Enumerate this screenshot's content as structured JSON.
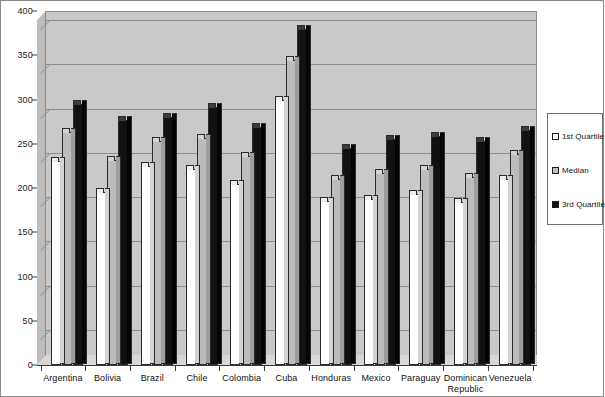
{
  "chart_data": {
    "type": "bar",
    "title": "",
    "subtitle": "",
    "xlabel": "",
    "ylabel": "",
    "ylim": [
      0,
      400
    ],
    "yticks": [
      0,
      50,
      100,
      150,
      200,
      250,
      300,
      350,
      400
    ],
    "grid": true,
    "legend_position": "right",
    "categories": [
      "Argentina",
      "Bolivia",
      "Brazil",
      "Chile",
      "Colombia",
      "Cuba",
      "Honduras",
      "Mexico",
      "Paraguay",
      "Dominican Republic",
      "Venezuela"
    ],
    "series": [
      {
        "name": "1st Quartile",
        "color": "#ffffff",
        "values": [
          230,
          196,
          225,
          222,
          205,
          300,
          185,
          188,
          193,
          184,
          210
        ]
      },
      {
        "name": "Median",
        "color": "#bcbcbc",
        "values": [
          263,
          232,
          253,
          256,
          236,
          345,
          210,
          217,
          221,
          212,
          238
        ]
      },
      {
        "name": "3rd Quartile",
        "color": "#111111",
        "values": [
          295,
          277,
          280,
          291,
          269,
          380,
          245,
          255,
          259,
          253,
          265
        ]
      }
    ]
  },
  "legend": {
    "items": [
      {
        "label": "1st Quartile",
        "swatch": "#ffffff"
      },
      {
        "label": "Median",
        "swatch": "#bcbcbc"
      },
      {
        "label": "3rd Quartile",
        "swatch": "#111111"
      }
    ]
  }
}
